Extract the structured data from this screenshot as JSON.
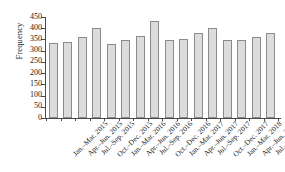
{
  "chart_data": {
    "type": "bar",
    "title": "",
    "xlabel": "",
    "ylabel": "Frequency",
    "ylim": [
      0,
      450
    ],
    "yticks": [
      0,
      50,
      100,
      150,
      200,
      250,
      300,
      350,
      400,
      450
    ],
    "grid": false,
    "legend": false,
    "categories": [
      "Jan.–Mar. 2015",
      "Apr.–Jun. 2015",
      "Jul.–Sep. 2015",
      "Oct.–Dec. 2015",
      "Jan.–Mar. 2016",
      "Apr.–Jun. 2016",
      "Jul.–Sep. 2016",
      "Oct.–Dec. 2016",
      "Jan.–Mar. 2017",
      "Apr.–Jun. 2017",
      "Jul.–Sep. 2017",
      "Oct.–Dec. 2017",
      "Jan.–Mar. 2018",
      "Apr.–Jun. 2018",
      "Jul.–Sep. 2018",
      "Oct.–Dec. 2018"
    ],
    "values": [
      333,
      337,
      360,
      402,
      332,
      348,
      366,
      433,
      348,
      352,
      381,
      399,
      348,
      347,
      360,
      380
    ],
    "bar_fill": "#dcdcdc",
    "bar_edge": "#8a8a8a",
    "axis_color": "#4a4a4a"
  }
}
